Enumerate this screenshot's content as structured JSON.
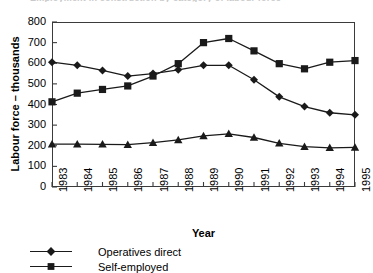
{
  "figure": {
    "title_remnant": "Employment in construction by category of labour force",
    "background_hex": "#ffffff",
    "line_hex": "#1a1a1a",
    "frame_hex": "#3b3b3b"
  },
  "axes": {
    "y_title": "Labour force – thousands",
    "x_title": "Year",
    "y_ticks": [
      "0",
      "100",
      "200",
      "300",
      "400",
      "500",
      "600",
      "700",
      "800"
    ],
    "x_ticks": [
      "1983",
      "1984",
      "1985",
      "1986",
      "1987",
      "1988",
      "1989",
      "1990",
      "1991",
      "1992",
      "1993",
      "1994",
      "1995"
    ]
  },
  "legend": {
    "position": "below-plot-left",
    "entries": [
      {
        "label": "Operatives direct",
        "marker": "diamond-marker",
        "color": "#1a1a1a"
      },
      {
        "label": "Self-employed",
        "marker": "square-marker",
        "color": "#1a1a1a"
      }
    ]
  },
  "chart_data": {
    "type": "line",
    "title": "",
    "xlabel": "Year",
    "ylabel": "Labour force – thousands",
    "categories": [
      "1983",
      "1984",
      "1985",
      "1986",
      "1987",
      "1988",
      "1989",
      "1990",
      "1991",
      "1992",
      "1993",
      "1994",
      "1995"
    ],
    "x": [
      1983,
      1984,
      1985,
      1986,
      1987,
      1988,
      1989,
      1990,
      1991,
      1992,
      1993,
      1994,
      1995
    ],
    "ylim": [
      0,
      800
    ],
    "ytick_step": 100,
    "grid": false,
    "legend_position": "bottom-left",
    "series": [
      {
        "name": "Operatives direct",
        "marker": "diamond",
        "color": "#1a1a1a",
        "values": [
          605,
          590,
          565,
          538,
          550,
          568,
          590,
          590,
          520,
          437,
          390,
          360,
          350
        ]
      },
      {
        "name": "Self-employed",
        "marker": "square",
        "color": "#1a1a1a",
        "values": [
          413,
          455,
          473,
          490,
          538,
          598,
          700,
          720,
          660,
          598,
          573,
          605,
          613
        ]
      },
      {
        "name": "",
        "marker": "triangle",
        "color": "#1a1a1a",
        "values": [
          208,
          208,
          207,
          205,
          215,
          228,
          248,
          258,
          240,
          212,
          196,
          190,
          192
        ]
      }
    ]
  }
}
